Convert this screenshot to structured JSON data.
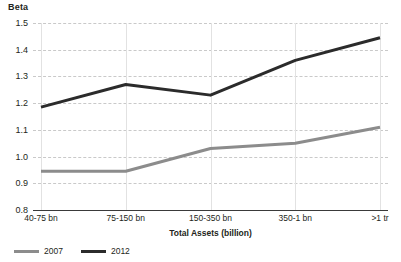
{
  "chart_data": {
    "type": "line",
    "title": "",
    "ylabel": "Beta",
    "xlabel": "Total Assets (billion)",
    "categories": [
      "40-75 bn",
      "75-150 bn",
      "150-350 bn",
      "350-1 bn",
      ">1 tr"
    ],
    "ylim": [
      0.8,
      1.5
    ],
    "yticks": [
      "0.8",
      "0.9",
      "1.0",
      "1.1",
      "1.2",
      "1.3",
      "1.4",
      "1.5"
    ],
    "ytick_values": [
      0.8,
      0.9,
      1.0,
      1.1,
      1.2,
      1.3,
      1.4,
      1.5
    ],
    "grid": true,
    "legend_position": "bottom-left",
    "series": [
      {
        "name": "2007",
        "color": "#8c8c8c",
        "values": [
          0.945,
          0.945,
          1.03,
          1.05,
          1.11
        ]
      },
      {
        "name": "2012",
        "color": "#2b2b2b",
        "values": [
          1.185,
          1.27,
          1.23,
          1.36,
          1.445
        ]
      }
    ]
  },
  "legend": {
    "items": [
      {
        "label": "2007",
        "color": "#8c8c8c"
      },
      {
        "label": "2012",
        "color": "#2b2b2b"
      }
    ]
  },
  "axes": {
    "y_title": "Beta",
    "x_title": "Total Assets (billion)"
  }
}
